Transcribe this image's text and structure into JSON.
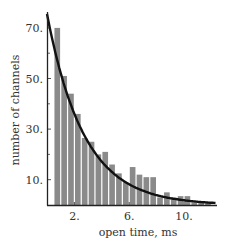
{
  "chart_data": {
    "type": "bar",
    "title": "",
    "xlabel": "open time, ms",
    "ylabel": "number of channels",
    "xlim": [
      0,
      12.4
    ],
    "ylim": [
      0,
      75
    ],
    "x_ticks": [
      2,
      6,
      10
    ],
    "x_tick_labels": [
      "2.",
      "6.",
      "10."
    ],
    "y_ticks": [
      10,
      30,
      50,
      70
    ],
    "y_tick_labels": [
      "10.",
      "30.",
      "50.",
      "70."
    ],
    "y_minor_ticks": [
      20,
      40,
      60
    ],
    "grid": false,
    "legend": null,
    "bin_width": 0.5,
    "bin_starts": [
      0.5,
      1.0,
      1.5,
      2.0,
      2.5,
      3.0,
      3.5,
      4.0,
      4.5,
      5.0,
      5.5,
      6.0,
      6.5,
      7.0,
      7.5,
      8.0,
      8.5,
      9.0,
      9.5,
      10.0,
      10.5,
      11.0,
      11.5
    ],
    "values": [
      70,
      51,
      44,
      36,
      26.5,
      25,
      20,
      21,
      16,
      12.5,
      9,
      15,
      12,
      11,
      11,
      3,
      5,
      3,
      3.5,
      3.5,
      1,
      1,
      1
    ],
    "series": [
      {
        "name": "histogram",
        "kind": "bar",
        "color": "#8a8a8a"
      },
      {
        "name": "exponential fit",
        "kind": "line",
        "color": "#111111",
        "y0": 75.5,
        "tau_ms": 2.7
      }
    ]
  },
  "colors": {
    "bar": "#8a8a8a",
    "curve": "#111111",
    "axis": "#222222",
    "text": "#333333"
  }
}
